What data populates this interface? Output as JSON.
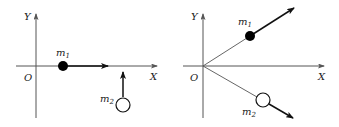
{
  "diagrams": [
    {
      "name": "before-collision",
      "axis_x_label": "X",
      "axis_y_label": "Y",
      "origin_label": "O",
      "mass1": {
        "label": "m",
        "sub": "1",
        "fill": "#000000"
      },
      "mass2": {
        "label": "m",
        "sub": "2",
        "fill": "#ffffff"
      }
    },
    {
      "name": "after-collision",
      "axis_x_label": "X",
      "axis_y_label": "Y",
      "origin_label": "O",
      "mass1": {
        "label": "m",
        "sub": "1",
        "fill": "#000000"
      },
      "mass2": {
        "label": "m",
        "sub": "2",
        "fill": "#ffffff"
      }
    }
  ],
  "colors": {
    "axis": "#555555",
    "line": "#111111"
  }
}
